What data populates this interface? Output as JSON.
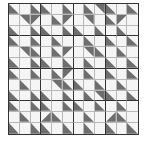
{
  "puzzle": {
    "rows": 12,
    "cols": 12,
    "block_size": 3,
    "colors": {
      "dark": "#6e6e6e",
      "light": "#f5f5f5",
      "thin_line": "#b8b8b8",
      "thick_line": "#333333"
    },
    "cell_legend": {
      "": "blank",
      "TL": "dark triangle top-left",
      "TR": "dark triangle top-right",
      "BL": "dark triangle bottom-left",
      "BR": "dark triangle bottom-right"
    },
    "grid": [
      [
        "BL",
        "",
        "BL",
        "BL",
        "",
        "BL",
        "",
        "BL",
        "TR",
        "BL",
        "",
        "BL"
      ],
      [
        "",
        "TR",
        "TL",
        "",
        "BL",
        "TL",
        "",
        "TR",
        "",
        "BL",
        "TL",
        ""
      ],
      [
        "BL",
        "",
        "BL",
        "BL",
        "",
        "BL",
        "BL",
        "",
        "BL",
        "",
        "BL",
        ""
      ],
      [
        "BL",
        "",
        "BL",
        "",
        "BL",
        "",
        "",
        "BL",
        "",
        "BL",
        "",
        "BL"
      ],
      [
        "",
        "TR",
        "BL",
        "",
        "BL",
        "TL",
        "",
        "TR",
        "BL",
        "",
        "BL",
        ""
      ],
      [
        "BL",
        "",
        "BL",
        "BL",
        "",
        "BL",
        "",
        "BL",
        "",
        "BL",
        "",
        "BL"
      ],
      [
        "BL",
        "",
        "BL",
        "",
        "BL",
        "TL",
        "",
        "BL",
        "",
        "BL",
        "",
        "BL"
      ],
      [
        "",
        "BL",
        "",
        "",
        "TR",
        "BL",
        "BL",
        "",
        "BL",
        "",
        "BL",
        ""
      ],
      [
        "BL",
        "",
        "BL",
        "BL",
        "",
        "BL",
        "",
        "BL",
        "TR",
        "BL",
        "",
        "BL"
      ],
      [
        "BL",
        "",
        "BL",
        "BL",
        "",
        "BL",
        "BL",
        "",
        "BL",
        "",
        "BL",
        ""
      ],
      [
        "",
        "BL",
        "",
        "BR",
        "BL",
        "",
        "",
        "BL",
        "",
        "BR",
        "BL",
        ""
      ],
      [
        "BL",
        "",
        "BL",
        "BL",
        "",
        "BL",
        "",
        "BL",
        "",
        "BL",
        "",
        "BL"
      ]
    ]
  }
}
